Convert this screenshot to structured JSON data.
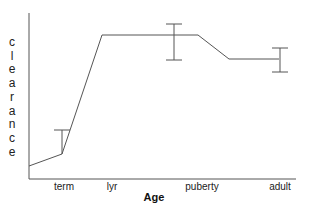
{
  "chart_data": {
    "type": "line",
    "title": "",
    "xlabel": "Age",
    "ylabel": "clearance",
    "ylabel_letters": [
      "c",
      "l",
      "e",
      "a",
      "r",
      "a",
      "n",
      "c",
      "e"
    ],
    "categories": [
      "term",
      "lyr",
      "puberty",
      "adult"
    ],
    "grid": false,
    "legend": null,
    "series": [
      {
        "name": "clearance",
        "points_px": [
          [
            29,
            166
          ],
          [
            62,
            154
          ],
          [
            102,
            35
          ],
          [
            198,
            35
          ],
          [
            229,
            59
          ],
          [
            279,
            59
          ]
        ],
        "relative_values": [
          0.1,
          0.15,
          0.87,
          0.87,
          0.72,
          0.72
        ]
      }
    ],
    "error_bars": [
      {
        "label": "term",
        "x": 62,
        "top": 130,
        "bottom": 154
      },
      {
        "label": "puberty",
        "x": 174,
        "top": 24,
        "bottom": 60
      },
      {
        "label": "adult",
        "x": 280,
        "top": 48,
        "bottom": 72
      }
    ],
    "tick_positions": [
      {
        "label": "term",
        "x": 64
      },
      {
        "label": "lyr",
        "x": 112
      },
      {
        "label": "puberty",
        "x": 202
      },
      {
        "label": "adult",
        "x": 280
      }
    ],
    "color": "#555555"
  }
}
